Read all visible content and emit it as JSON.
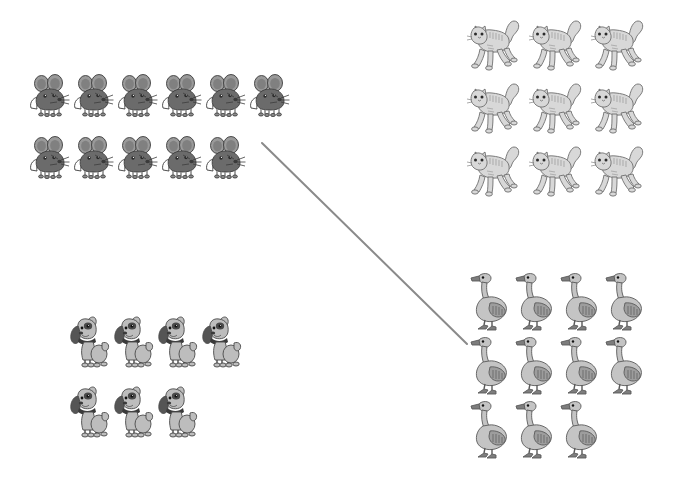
{
  "page": {
    "background_color": "#ffffff",
    "width": 678,
    "height": 490
  },
  "groups": [
    {
      "id": "mice",
      "animal": "mouse",
      "icon_name": "mouse-icon",
      "label": "Mice",
      "count": 11,
      "rows": [
        6,
        5
      ],
      "position": {
        "x": 28,
        "y": 56
      },
      "cell": {
        "w": 44,
        "h": 62
      },
      "colors": {
        "body": "#6b6b6b",
        "ear": "#9a9a9a",
        "outline": "#3c3c3c",
        "foot": "#8e8e8e"
      }
    },
    {
      "id": "cats",
      "animal": "cat",
      "icon_name": "cat-icon",
      "label": "Cats",
      "count": 9,
      "rows": [
        3,
        3,
        3
      ],
      "position": {
        "x": 466,
        "y": 10
      },
      "cell": {
        "w": 62,
        "h": 63
      },
      "colors": {
        "body": "#d8d8d8",
        "stripe": "#aeaeae",
        "outline": "#6e6e6e",
        "belly": "#ededed"
      }
    },
    {
      "id": "dogs",
      "animal": "dog",
      "icon_name": "dog-icon",
      "label": "Dogs",
      "count": 7,
      "rows": [
        4,
        3
      ],
      "position": {
        "x": 66,
        "y": 300
      },
      "cell": {
        "w": 44,
        "h": 70
      },
      "colors": {
        "body": "#bdbdbd",
        "patch": "#4a4a4a",
        "collar": "#3a3a3a",
        "outline": "#4a4a4a"
      }
    },
    {
      "id": "geese",
      "animal": "goose",
      "icon_name": "goose-icon",
      "label": "Geese",
      "count": 11,
      "rows": [
        4,
        4,
        3
      ],
      "position": {
        "x": 470,
        "y": 268
      },
      "cell": {
        "w": 45,
        "h": 64
      },
      "colors": {
        "body": "#c4c4c4",
        "wing": "#9d9d9d",
        "outline": "#5a5a5a",
        "beak": "#7d7d7d"
      }
    }
  ],
  "connectors": [
    {
      "id": "mice-to-geese",
      "name": "mice-to-geese-connector",
      "from_group": "mice",
      "to_group": "geese",
      "from_point": {
        "x": 262,
        "y": 143
      },
      "to_point": {
        "x": 467,
        "y": 344
      },
      "color": "#8a8a8a",
      "width": 2
    }
  ]
}
